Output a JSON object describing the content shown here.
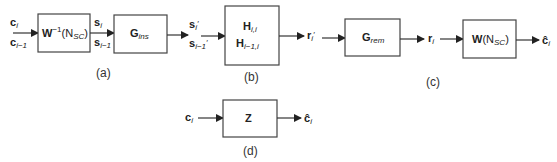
{
  "diagram": {
    "panels": [
      {
        "caption": "(a)",
        "blocks": [
          {
            "id": "w_inv",
            "label_main": "W",
            "label_sup": "−1",
            "label_args": "(N",
            "label_args_sub": "SC",
            "label_args_close": ")"
          },
          {
            "id": "g_ins",
            "label_main": "G",
            "label_sub": "ins"
          }
        ],
        "signals": {
          "input": {
            "line1": "c",
            "line1_sub": "i",
            "line2": "c",
            "line2_sub": "i−1"
          },
          "mid": {
            "line1": "s",
            "line1_sub": "i",
            "line2": "s",
            "line2_sub": "i−1"
          },
          "output": {
            "line1": "s",
            "line1_sub": "i",
            "line1_prime": "′",
            "line2": "s",
            "line2_sub": "i−1",
            "line2_prime": "′"
          }
        }
      },
      {
        "caption": "(b)",
        "blocks": [
          {
            "id": "h",
            "line1": "H",
            "line1_sub": "i,i",
            "line2": "H",
            "line2_sub": "i−1,i"
          }
        ],
        "signals": {
          "output": {
            "label": "r",
            "sub": "i",
            "prime": "′"
          }
        }
      },
      {
        "caption": "(c)",
        "blocks": [
          {
            "id": "g_rem",
            "label_main": "G",
            "label_sub": "rem"
          },
          {
            "id": "w",
            "label_main": "W",
            "label_args": "(N",
            "label_args_sub": "SC",
            "label_args_close": ")"
          }
        ],
        "signals": {
          "mid": {
            "label": "r",
            "sub": "i"
          },
          "output": {
            "label": "ĉ",
            "sub": "i"
          }
        }
      },
      {
        "caption": "(d)",
        "blocks": [
          {
            "id": "z",
            "label_main": "Z"
          }
        ],
        "signals": {
          "input": {
            "label": "c",
            "sub": "i"
          },
          "output": {
            "label": "ĉ",
            "sub": "i"
          }
        }
      }
    ]
  }
}
